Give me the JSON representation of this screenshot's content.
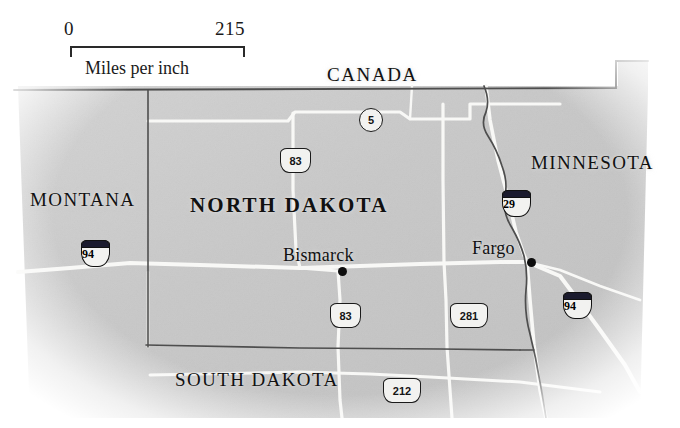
{
  "figure": {
    "kind": "reference-map",
    "subject": "North Dakota"
  },
  "scale": {
    "min_label": "0",
    "max_label": "215",
    "caption": "Miles per inch",
    "units": "miles per inch"
  },
  "labels": {
    "canada": "CANADA",
    "minnesota": "MINNESOTA",
    "montana": "MONTANA",
    "north_dakota": "NORTH DAKOTA",
    "south_dakota": "SOUTH DAKOTA"
  },
  "cities": [
    {
      "name": "Bismarck",
      "role": "state-capital"
    },
    {
      "name": "Fargo",
      "role": "city"
    }
  ],
  "routes": [
    {
      "id": "5",
      "number": "5",
      "type": "state"
    },
    {
      "id": "83n",
      "number": "83",
      "type": "us"
    },
    {
      "id": "83s",
      "number": "83",
      "type": "us"
    },
    {
      "id": "281",
      "number": "281",
      "type": "us"
    },
    {
      "id": "212",
      "number": "212",
      "type": "us"
    },
    {
      "id": "29",
      "number": "29",
      "type": "interstate"
    },
    {
      "id": "94w",
      "number": "94",
      "type": "interstate"
    },
    {
      "id": "94e",
      "number": "94",
      "type": "interstate"
    }
  ],
  "colors": {
    "land": "#c9c9c9",
    "road": "#f8f8f6",
    "border": "#4a4a4a",
    "ink": "#111111",
    "interstate_band": "#1b1b2e",
    "paper": "#ffffff"
  }
}
